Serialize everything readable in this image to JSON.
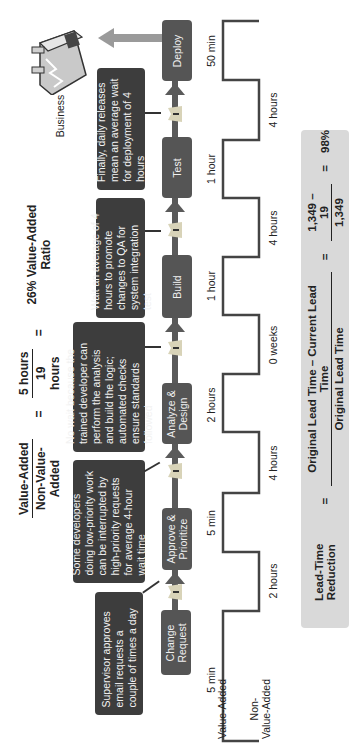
{
  "header_formula": {
    "numerator_label": "Value-Added",
    "denominator_label": "Non-Value-Added",
    "eq1": "=",
    "numerator_value": "5 hours",
    "denominator_value": "19 hours",
    "eq2": "=",
    "result": "26% Value-Added Ratio"
  },
  "process_steps": [
    {
      "label_line1": "Change",
      "label_line2": "Request"
    },
    {
      "label_line1": "Approve &",
      "label_line2": "Prioritize"
    },
    {
      "label_line1": "Analyze &",
      "label_line2": "Design"
    },
    {
      "label_line1": "Build",
      "label_line2": ""
    },
    {
      "label_line1": "Test",
      "label_line2": ""
    },
    {
      "label_line1": "Deploy",
      "label_line2": ""
    }
  ],
  "callouts": [
    {
      "text": "Supervisor approves email requests a couple of times a day"
    },
    {
      "text": "Some developers doing low-priority work can be interrupted by high-priority requests for average 4-hour wait time"
    },
    {
      "text": "No wait because the trained developer can perform the analysis and build the logic; automated checks ensure standards followed"
    },
    {
      "text": "Wait an average of 4 hours to promote changes to QA for system integration test"
    },
    {
      "text": "Finally, daily releases mean an average wait for deployment of 4 hours"
    }
  ],
  "customer": {
    "label": "Business",
    "icon": "factory-icon"
  },
  "inventory_icon": "inventory-triangle-icon",
  "timeline": {
    "level_labels": {
      "value_added": "Value-Added",
      "non_value_added_line1": "Non-",
      "non_value_added_line2": "Value-Added"
    },
    "value_added_times": [
      "5 min",
      "5 min",
      "2 hours",
      "1 hour",
      "1 hour",
      "50 min"
    ],
    "non_value_added_times": [
      "2 hours",
      "4 hours",
      "0 weeks",
      "4 hours",
      "4 hours"
    ]
  },
  "lead_time_formula": {
    "label": "Lead-Time Reduction",
    "eq1": "=",
    "numerator_expr": "Original Lead Time – Current Lead Time",
    "denominator_expr": "Original Lead Time",
    "eq2": "=",
    "numerator_value": "1,349 – 19",
    "denominator_value": "1,349",
    "eq3": "=",
    "result": "98%"
  },
  "colors": {
    "callout_bg": "#3d3d3d",
    "process_bg": "#555555",
    "flow_arrow": "#5a5a5a",
    "customer_arrow": "#9a9a9a",
    "formula_box_bg": "#d9d9d9",
    "timeline_line": "#444444",
    "inventory_fill": "#d8d3b8"
  }
}
